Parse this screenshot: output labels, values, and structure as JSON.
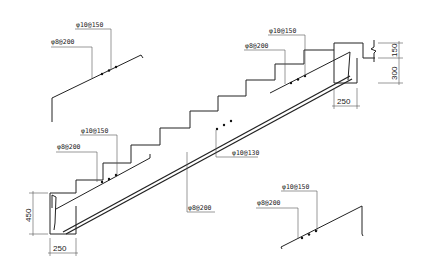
{
  "drawing": {
    "type": "stair-reinforcement-detail",
    "labels": {
      "top_left_upper": "φ10@150",
      "top_left_lower": "φ8@200",
      "top_right_upper": "φ10@150",
      "top_right_lower": "φ8@200",
      "mid_left_upper": "φ10@150",
      "mid_left_lower": "φ8@200",
      "slab_main": "φ10@130",
      "slab_dist": "φ8@200",
      "bottom_right_upper": "φ10@150",
      "bottom_right_lower": "φ8@200"
    },
    "dimensions": {
      "top_beam_depth": "150",
      "top_beam_height": "300",
      "top_beam_width": "250",
      "bottom_beam_height": "450",
      "bottom_beam_width": "250"
    }
  }
}
